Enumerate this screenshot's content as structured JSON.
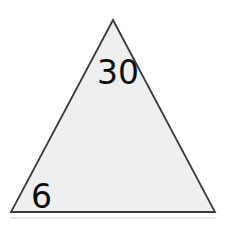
{
  "figure": {
    "name": "isosceles-triangle-with-measures",
    "background_color": "#ffffff",
    "width": 229,
    "height": 226,
    "shape": {
      "type": "triangle",
      "name": "triangle",
      "fill_color": "#efefef",
      "stroke_color": "#3a3a3a",
      "stroke_width": 1.8,
      "vertices": {
        "apex": [
          113,
          20
        ],
        "bottom_left": [
          11,
          212
        ],
        "bottom_right": [
          215,
          212
        ]
      },
      "vertices_points": "113,20 11,212 215,212"
    },
    "baseline_shadow": {
      "name": "base-shadow-line",
      "color": "#d8d8d8",
      "y": 218
    },
    "labels": [
      {
        "name": "angle-label-30",
        "text": "30",
        "x": 97,
        "y": 84,
        "color": "#101010",
        "font_size": 33
      },
      {
        "name": "angle-label-6",
        "text": "6",
        "x": 31,
        "y": 208,
        "color": "#101010",
        "font_size": 33
      }
    ]
  }
}
